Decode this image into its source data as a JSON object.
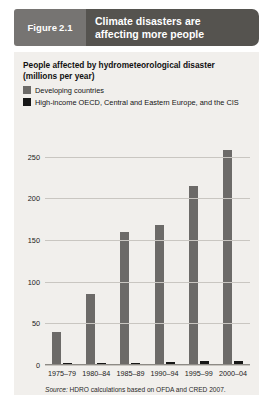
{
  "figure": {
    "label": "Figure",
    "number": "2.1",
    "title_line1": "Climate disasters are",
    "title_line2": "affecting more people"
  },
  "subtitle_line1": "People affected by hydrometeorological disaster",
  "subtitle_line2": "(millions  per year)",
  "source": {
    "label": "Source:",
    "text": "HDRO calculations based on OFDA and CRED 2007."
  },
  "colors": {
    "developing": "#6c6a68",
    "oecd": "#171717",
    "panel_background": "#f1efec",
    "title_bar": "#55534f",
    "figure_tab": "#767472",
    "gridline": "#c9c6c1"
  },
  "chart_data": {
    "type": "bar",
    "title": "People affected by hydrometeorological disaster (millions per year)",
    "xlabel": "",
    "ylabel": "",
    "ylim": [
      0,
      275
    ],
    "yticks": [
      0,
      50,
      100,
      150,
      200,
      250
    ],
    "ytick_labels": [
      "0",
      "50",
      "100",
      "150",
      "200",
      "250"
    ],
    "grid": true,
    "legend_position": "above-plot",
    "categories": [
      "1975–79",
      "1980–84",
      "1985–89",
      "1990–94",
      "1995–99",
      "2000–04"
    ],
    "series": [
      {
        "name": "Developing countries",
        "color": "#6c6a68",
        "values": [
          40,
          85,
          160,
          168,
          215,
          258
        ]
      },
      {
        "name": "High-income OECD, Central and Eastern Europe, and the CIS",
        "color": "#171717",
        "values": [
          1,
          1,
          1.5,
          4,
          4.5,
          5
        ]
      }
    ]
  }
}
